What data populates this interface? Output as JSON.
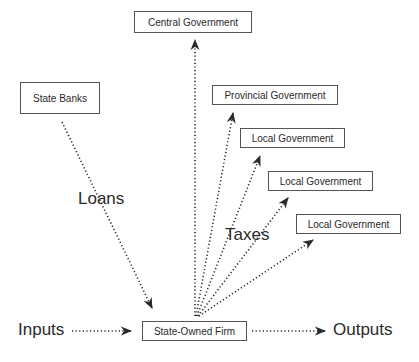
{
  "diagram": {
    "nodes": {
      "central_government": "Central Government",
      "provincial_government": "Provincial Government",
      "local_government_1": "Local Government",
      "local_government_2": "Local Government",
      "local_government_3": "Local Government",
      "state_banks": "State Banks",
      "state_owned_firm": "State-Owned Firm"
    },
    "labels": {
      "loans": "Loans",
      "taxes": "Taxes",
      "inputs": "Inputs",
      "outputs": "Outputs"
    },
    "edges": [
      {
        "from": "state_banks",
        "to": "state_owned_firm",
        "label": "Loans",
        "style": "dotted"
      },
      {
        "from": "state_owned_firm",
        "to": "central_government",
        "label": "Taxes",
        "style": "dotted"
      },
      {
        "from": "state_owned_firm",
        "to": "provincial_government",
        "label": "Taxes",
        "style": "dotted"
      },
      {
        "from": "state_owned_firm",
        "to": "local_government_1",
        "label": "Taxes",
        "style": "dotted"
      },
      {
        "from": "state_owned_firm",
        "to": "local_government_2",
        "label": "Taxes",
        "style": "dotted"
      },
      {
        "from": "state_owned_firm",
        "to": "local_government_3",
        "label": "Taxes",
        "style": "dotted"
      },
      {
        "from": "inputs",
        "to": "state_owned_firm",
        "style": "dotted"
      },
      {
        "from": "state_owned_firm",
        "to": "outputs",
        "style": "dotted"
      }
    ]
  }
}
